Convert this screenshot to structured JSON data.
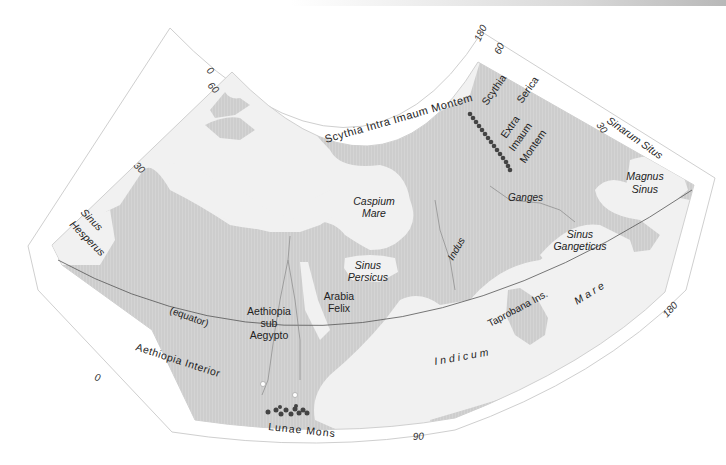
{
  "header": {
    "text": "CARTOGRAPHY OF THE ANCIENTS",
    "page": "| 11"
  },
  "map": {
    "title": "Ptolemaic World Map",
    "colors": {
      "land": "#d2d2d2",
      "land_hatch": "#c4c4c4",
      "sea": "#f1f1f1",
      "frame": "#ffffff",
      "frame_stroke": "#cfcfcf",
      "mountains": "#444444",
      "text": "#222222"
    },
    "graticule_labels": {
      "lon_0_top": "0",
      "lat_60_left": "60",
      "lat_30_left": "30",
      "lon_0_bottom": "0",
      "lon_90_bottom": "90",
      "lon_180_top": "180",
      "lat_60_right": "60",
      "lat_30_right": "30",
      "lon_180_right": "180"
    },
    "equator_label": "(equator)",
    "regions": {
      "scythia_intra": "Scythia Intra Imaum Montem",
      "scythia_serica_1": "Scythia",
      "scythia_serica_2": "Serica",
      "extra_1": "Extra",
      "extra_2": "Imaum",
      "extra_3": "Montem",
      "sinarum_situs": "Sinarum Situs",
      "magnus_sinus_1": "Magnus",
      "magnus_sinus_2": "Sinus",
      "sinus_hesperus_1": "Sinus",
      "sinus_hesperus_2": "Hesperus",
      "caspium_1": "Caspium",
      "caspium_2": "Mare",
      "ganges": "Ganges",
      "indus": "Indus",
      "sinus_persicus_1": "Sinus",
      "sinus_persicus_2": "Persicus",
      "sinus_gangeticus_1": "Sinus",
      "sinus_gangeticus_2": "Gangeticus",
      "arabia_1": "Arabia",
      "arabia_2": "Felix",
      "aethiopia_sub_1": "Aethiopia",
      "aethiopia_sub_2": "sub",
      "aethiopia_sub_3": "Aegypto",
      "aethiopia_interior": "Aethiopia Interior",
      "taprobana": "Taprobana Ins.",
      "mare": "Mare",
      "indicum": "Indicum",
      "lunae_mons": "Lunae Mons"
    }
  }
}
